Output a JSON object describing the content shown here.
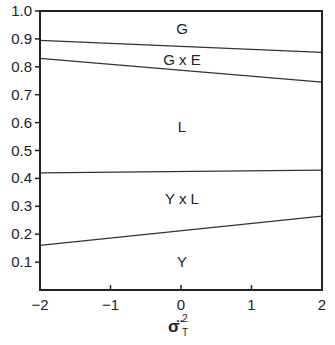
{
  "chart_data": {
    "type": "line",
    "title": "",
    "xlabel": "σ̈T²",
    "xlabel_parts": {
      "base": "σ̈",
      "sup": "2",
      "sub": "T"
    },
    "ylabel": "",
    "xlim": [
      -2,
      2
    ],
    "ylim": [
      0,
      1.0
    ],
    "grid": false,
    "x_ticks": [
      "−2",
      "−1",
      "0",
      "1",
      "2"
    ],
    "y_ticks": [
      "0.1",
      "0.2",
      "0.3",
      "0.4",
      "0.5",
      "0.6",
      "0.7",
      "0.8",
      "0.9",
      "1.0"
    ],
    "x": [
      -2,
      2
    ],
    "series": [
      {
        "name": "Y / Y x L boundary",
        "values": [
          0.16,
          0.265
        ]
      },
      {
        "name": "Y x L / L boundary",
        "values": [
          0.42,
          0.43
        ]
      },
      {
        "name": "L / G x E boundary",
        "values": [
          0.83,
          0.745
        ]
      },
      {
        "name": "G x E / G boundary",
        "values": [
          0.895,
          0.852
        ]
      }
    ],
    "region_labels": [
      {
        "text": "G",
        "x": 0,
        "y": 0.935
      },
      {
        "text": "G x E",
        "y": 0.825,
        "x": 0
      },
      {
        "text": "L",
        "x": 0,
        "y": 0.585
      },
      {
        "text": "Y x L",
        "x": 0,
        "y": 0.325
      },
      {
        "text": "Y",
        "x": 0,
        "y": 0.1
      }
    ],
    "legend": "none"
  }
}
